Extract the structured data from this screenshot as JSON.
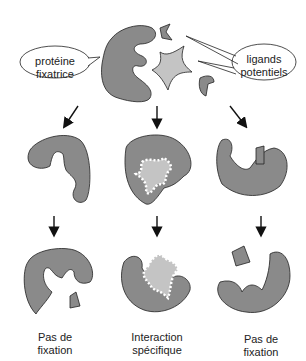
{
  "labels": {
    "protein": [
      "protéine",
      "fixatrice"
    ],
    "ligands": [
      "ligands",
      "potentiels"
    ],
    "left_result": [
      "Pas de",
      "fixation"
    ],
    "middle_result": [
      "Interaction",
      "spécifique"
    ],
    "right_result": [
      "Pas de",
      "fixation"
    ]
  },
  "colors": {
    "protein_fill": "#8a8a8a",
    "star_fill": "#c4c4c4",
    "outline": "#222222",
    "fuzz": "#9a9a9a"
  }
}
